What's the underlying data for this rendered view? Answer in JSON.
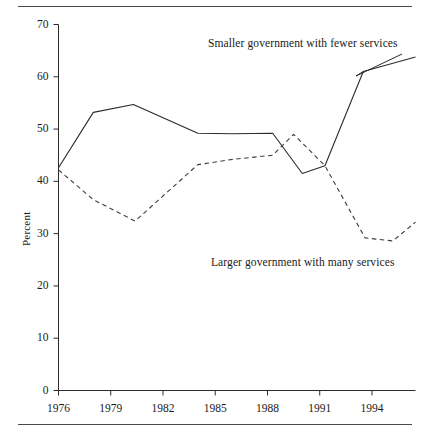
{
  "figure": {
    "has_top_rule": true,
    "has_bottom_rule": true,
    "rule_color": "#4a4a4a",
    "background": "#ffffff"
  },
  "chart_data": {
    "type": "line",
    "title": "",
    "xlabel": "",
    "ylabel": "Percent",
    "xlim": [
      1976,
      1996.5
    ],
    "ylim": [
      0,
      70
    ],
    "grid": false,
    "legend_position": "inline-annotations",
    "xticks": [
      "1976",
      "1979",
      "1982",
      "1985",
      "1988",
      "1991",
      "1994"
    ],
    "xtick_values": [
      1976,
      1979,
      1982,
      1985,
      1988,
      1991,
      1994
    ],
    "yticks": [
      "0",
      "10",
      "20",
      "30",
      "40",
      "50",
      "60",
      "70"
    ],
    "ytick_values": [
      0,
      10,
      20,
      30,
      40,
      50,
      60,
      70
    ],
    "series": [
      {
        "name": "Smaller government with fewer services",
        "style": "solid",
        "color": "#2b2b2b",
        "x": [
          1976,
          1978,
          1980.3,
          1984,
          1986,
          1988.3,
          1990,
          1991.3,
          1993.5,
          1996.5
        ],
        "values": [
          42.6,
          53.2,
          54.7,
          49.2,
          49.1,
          49.2,
          41.5,
          43.0,
          61.0,
          63.8
        ]
      },
      {
        "name": "Larger government with many services",
        "style": "dashed",
        "color": "#3c3c46",
        "x": [
          1976,
          1978,
          1980.4,
          1984,
          1986,
          1988.3,
          1989.5,
          1991.3,
          1993.6,
          1995.2,
          1996.5
        ],
        "values": [
          42.2,
          36.5,
          32.4,
          43.2,
          44.2,
          45.0,
          49.0,
          43.0,
          29.2,
          28.6,
          32.2
        ]
      }
    ],
    "annotations": [
      {
        "id": "upper",
        "text": "Smaller government with fewer services",
        "target_series": "Smaller government with fewer services"
      },
      {
        "id": "lower",
        "text": "Larger government with many services",
        "target_series": "Larger government with many services"
      }
    ]
  }
}
